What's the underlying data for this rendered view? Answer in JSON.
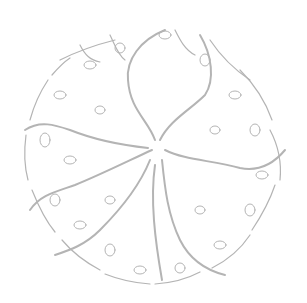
{
  "figure": {
    "description": "Line-art tree canopy viewed from above with five main branches radiating from a central trunk, ending in leafy twigs forming a circular outline",
    "line_color": "#b4b4b4",
    "background_color": "#ffffff",
    "canopy_center": [
      155,
      145
    ],
    "canopy_radius": 128,
    "main_branches": 5
  }
}
